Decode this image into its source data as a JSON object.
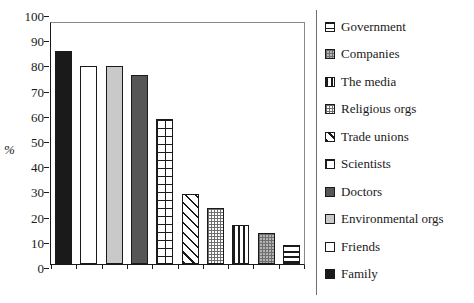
{
  "chart_data": {
    "type": "bar",
    "title": "",
    "subtitle": "",
    "xlabel": "",
    "ylabel": "%",
    "ylim": [
      0,
      100
    ],
    "ytick_step": 10,
    "yticks": [
      100,
      90,
      80,
      70,
      60,
      50,
      40,
      30,
      20,
      10,
      0
    ],
    "grid": false,
    "legend_position": "right",
    "xtick_labels_visible": false,
    "categories": [
      "Family",
      "Friends",
      "Environmental orgs",
      "Doctors",
      "Scientists",
      "Trade unions",
      "Religious orgs",
      "The media",
      "Companies",
      "Government"
    ],
    "values": [
      88,
      82,
      82,
      78,
      60,
      29,
      23,
      16,
      13,
      8
    ],
    "bars": [
      {
        "label": "Family",
        "value": 88,
        "pattern": "solid-black",
        "fill_class": "fill-black"
      },
      {
        "label": "Friends",
        "value": 82,
        "pattern": "solid-white",
        "fill_class": "fill-white"
      },
      {
        "label": "Environmental orgs",
        "value": 82,
        "pattern": "solid-light-gray",
        "fill_class": "fill-lightgray"
      },
      {
        "label": "Doctors",
        "value": 78,
        "pattern": "solid-dark-gray",
        "fill_class": "fill-darkgray"
      },
      {
        "label": "Scientists",
        "value": 60,
        "pattern": "grid",
        "fill_class": "fill-grid"
      },
      {
        "label": "Trade unions",
        "value": 29,
        "pattern": "diagonal-stripes",
        "fill_class": "fill-diagonal"
      },
      {
        "label": "Religious orgs",
        "value": 23,
        "pattern": "checker",
        "fill_class": "fill-checker"
      },
      {
        "label": "The media",
        "value": 16,
        "pattern": "vertical-stripes",
        "fill_class": "fill-vertical"
      },
      {
        "label": "Companies",
        "value": 13,
        "pattern": "gray-checker",
        "fill_class": "fill-graychecker"
      },
      {
        "label": "Government",
        "value": 8,
        "pattern": "horizontal-lines",
        "fill_class": "fill-horizontal"
      }
    ],
    "legend": [
      {
        "label": "Government",
        "pattern": "horizontal-lines",
        "fill_class": "fill-horizontal"
      },
      {
        "label": "Companies",
        "pattern": "gray-checker",
        "fill_class": "fill-graychecker"
      },
      {
        "label": "The media",
        "pattern": "vertical-stripes",
        "fill_class": "fill-vertical"
      },
      {
        "label": "Religious orgs",
        "pattern": "checker",
        "fill_class": "fill-checker"
      },
      {
        "label": "Trade unions",
        "pattern": "diagonal-stripes",
        "fill_class": "fill-diagonal"
      },
      {
        "label": "Scientists",
        "pattern": "grid",
        "fill_class": "fill-grid"
      },
      {
        "label": "Doctors",
        "pattern": "solid-dark-gray",
        "fill_class": "fill-darkgray"
      },
      {
        "label": "Environmental orgs",
        "pattern": "solid-light-gray",
        "fill_class": "fill-lightgray"
      },
      {
        "label": "Friends",
        "pattern": "solid-white",
        "fill_class": "fill-white"
      },
      {
        "label": "Family",
        "pattern": "solid-black",
        "fill_class": "fill-black"
      }
    ]
  },
  "colors": {
    "axis": "#1a1a1a",
    "frame_light": "#8a8a8a",
    "black_fill": "#1a1a1a",
    "dark_gray_fill": "#565656",
    "light_gray_fill": "#c9c9c9",
    "gray_checker_fill": "#b4b4b4",
    "background": "#ffffff"
  }
}
